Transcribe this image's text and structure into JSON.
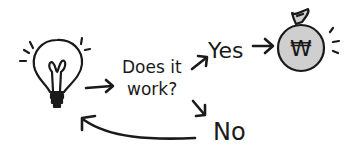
{
  "diagram": {
    "question_line1": "Does it",
    "question_line2": "work?",
    "yes_label": "Yes",
    "no_label": "No",
    "currency_symbol": "₩",
    "colors": {
      "ink": "#1a1a1a",
      "bag_fill": "#cfcfcf",
      "background": "#ffffff"
    },
    "nodes": [
      {
        "id": "idea",
        "icon": "lightbulb-icon"
      },
      {
        "id": "question",
        "label": "Does it work?"
      },
      {
        "id": "yes",
        "label": "Yes"
      },
      {
        "id": "money",
        "icon": "money-bag-icon"
      },
      {
        "id": "no",
        "label": "No"
      }
    ],
    "edges": [
      {
        "from": "idea",
        "to": "question"
      },
      {
        "from": "question",
        "to": "yes"
      },
      {
        "from": "yes",
        "to": "money"
      },
      {
        "from": "question",
        "to": "no"
      },
      {
        "from": "no",
        "to": "idea"
      }
    ]
  }
}
